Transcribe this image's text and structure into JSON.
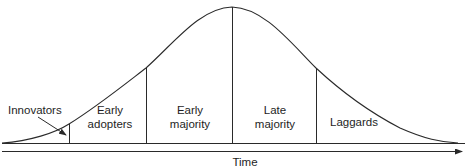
{
  "diagram": {
    "type": "diffusion-of-innovation-bell-curve",
    "segments": [
      {
        "id": "innovators",
        "line1": "Innovators",
        "line2": ""
      },
      {
        "id": "early-adopters",
        "line1": "Early",
        "line2": "adopters"
      },
      {
        "id": "early-majority",
        "line1": "Early",
        "line2": "majority"
      },
      {
        "id": "late-majority",
        "line1": "Late",
        "line2": "majority"
      },
      {
        "id": "laggards",
        "line1": "Laggards",
        "line2": ""
      }
    ],
    "x_axis_label": "Time",
    "colors": {
      "line": "#2a2a2a",
      "background": "#ffffff"
    }
  }
}
